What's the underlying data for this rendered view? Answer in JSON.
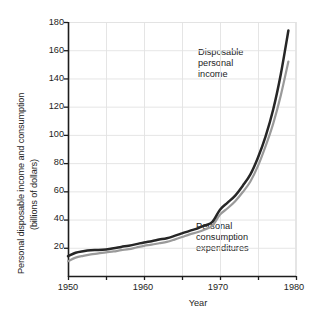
{
  "chart_data": {
    "type": "line",
    "title": "",
    "xlabel": "Year",
    "ylabel": "Personal disposable income and consumption (billions of dollars)",
    "ylabel_line1": "Personal disposable income and consumption",
    "ylabel_line2": "(billions of dollars)",
    "xlim": [
      1950,
      1980
    ],
    "ylim": [
      0,
      180
    ],
    "xticks": [
      1950,
      1960,
      1970,
      1980
    ],
    "xtick_labels": [
      "1950",
      "1960",
      "1970",
      "1980"
    ],
    "xminorticks": [
      1955,
      1965,
      1975
    ],
    "yticks": [
      20,
      40,
      60,
      80,
      100,
      120,
      140,
      160,
      180
    ],
    "ytick_labels": [
      "20",
      "40",
      "60",
      "80",
      "100",
      "120",
      "140",
      "160",
      "180"
    ],
    "grid": true,
    "grid_color": "#e2e2e2",
    "legend_position": "inline-annotations",
    "x": [
      1950,
      1951,
      1952,
      1953,
      1954,
      1955,
      1956,
      1957,
      1958,
      1959,
      1960,
      1961,
      1962,
      1963,
      1964,
      1965,
      1966,
      1967,
      1968,
      1969,
      1970,
      1971,
      1972,
      1973,
      1974,
      1975,
      1976,
      1977,
      1978,
      1979
    ],
    "series": [
      {
        "name": "Disposable personal income",
        "color": "#262626",
        "annotation": "Disposable\npersonal\nincome",
        "annotation_lines": [
          "Disposable",
          "personal",
          "income"
        ],
        "values": [
          14.0,
          16.5,
          17.6,
          18.3,
          18.4,
          18.8,
          19.6,
          20.6,
          21.5,
          22.6,
          23.8,
          24.7,
          25.8,
          26.8,
          28.4,
          30.2,
          32.0,
          33.6,
          35.8,
          38.3,
          47.0,
          52.0,
          57.0,
          64.0,
          72.0,
          84.0,
          99.0,
          118.0,
          143.0,
          174.0
        ]
      },
      {
        "name": "Personal consumption expenditures",
        "color": "#9a9a9a",
        "annotation": "Personal\nconsumption\nexpenditures",
        "annotation_lines": [
          "Personal",
          "consumption",
          "expenditures"
        ],
        "values": [
          10.5,
          13.0,
          14.3,
          15.3,
          16.0,
          16.8,
          17.4,
          18.3,
          19.0,
          20.2,
          21.4,
          22.2,
          23.2,
          24.2,
          25.8,
          27.6,
          29.5,
          31.0,
          33.0,
          35.6,
          43.5,
          48.0,
          53.0,
          59.5,
          67.0,
          78.0,
          92.0,
          108.0,
          128.0,
          152.0
        ]
      }
    ]
  }
}
